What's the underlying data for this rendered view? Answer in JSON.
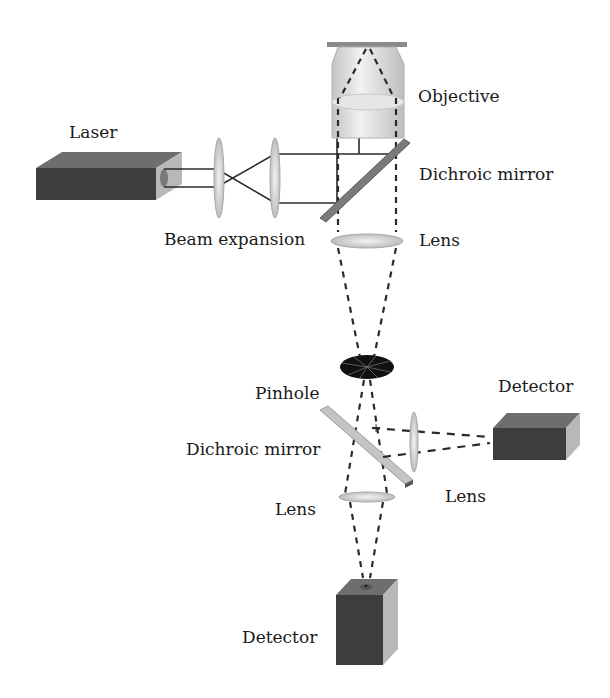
{
  "diagram": {
    "labels": {
      "laser": "Laser",
      "beam_expansion": "Beam expansion",
      "objective": "Objective",
      "dichroic_mirror_top": "Dichroic mirror",
      "lens_top": "Lens",
      "pinhole": "Pinhole",
      "dichroic_mirror_bottom": "Dichroic mirror",
      "detector_right": "Detector",
      "lens_right": "Lens",
      "lens_bottom": "Lens",
      "detector_bottom": "Detector"
    },
    "components": [
      {
        "id": "laser",
        "type": "box"
      },
      {
        "id": "beam-expander-lens-1",
        "type": "lens"
      },
      {
        "id": "beam-expander-lens-2",
        "type": "lens"
      },
      {
        "id": "objective",
        "type": "objective"
      },
      {
        "id": "dichroic-mirror-1",
        "type": "mirror"
      },
      {
        "id": "tube-lens",
        "type": "lens"
      },
      {
        "id": "pinhole",
        "type": "aperture"
      },
      {
        "id": "dichroic-mirror-2",
        "type": "mirror"
      },
      {
        "id": "side-lens",
        "type": "lens"
      },
      {
        "id": "side-detector",
        "type": "box"
      },
      {
        "id": "bottom-lens",
        "type": "lens"
      },
      {
        "id": "bottom-detector",
        "type": "box"
      }
    ],
    "colors": {
      "box_front": "#3d3d3d",
      "box_top": "#6e6e6e",
      "box_side": "#b8b8b8",
      "lens": "#d9d9d9",
      "mirror": "#8a8a8a",
      "beam": "#2a2a2a"
    }
  }
}
